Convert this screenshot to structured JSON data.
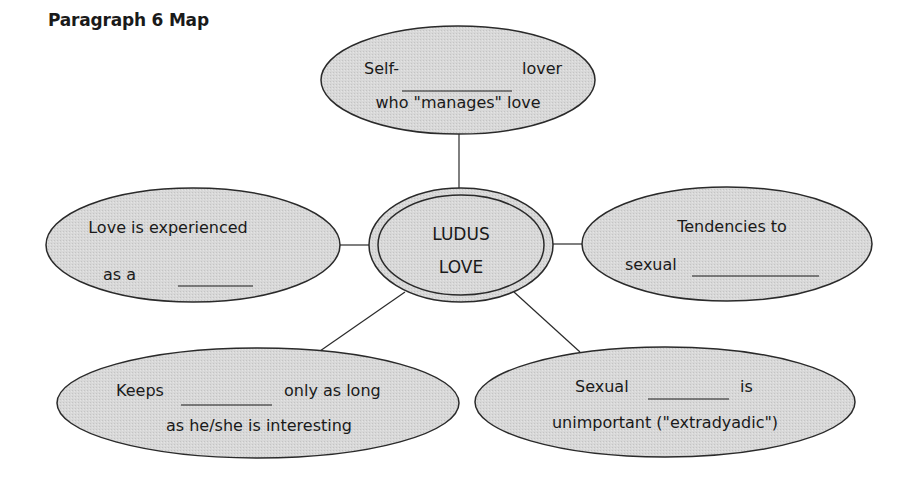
{
  "title": "Paragraph 6 Map",
  "colors": {
    "node_fill": "#d6d6d6",
    "node_stroke": "#2a2a2a",
    "connector": "#2a2a2a",
    "text": "#1a1a1a"
  },
  "center": {
    "line1": "LUDUS",
    "line2": "LOVE"
  },
  "nodes": {
    "top": {
      "line1_pre": "Self-",
      "line1_post": "lover",
      "line2": "who \"manages\" love"
    },
    "left": {
      "line1": "Love is experienced",
      "line2_pre": "as a"
    },
    "right": {
      "line1": "Tendencies to",
      "line2_pre": "sexual"
    },
    "bottom_left": {
      "line1_pre": "Keeps",
      "line1_post": "only as long",
      "line2": "as he/she is interesting"
    },
    "bottom_right": {
      "line1_pre": "Sexual",
      "line1_post": "is",
      "line2": "unimportant (\"extradyadic\")"
    }
  }
}
